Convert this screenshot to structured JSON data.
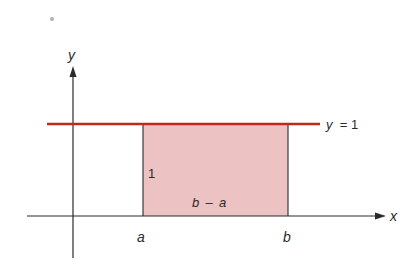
{
  "diagram": {
    "axes": {
      "x_label": "x",
      "y_label": "y"
    },
    "line": {
      "label_var": "y",
      "label_eq": "= 1",
      "color": "#c0281e"
    },
    "rectangle": {
      "fill": "#ecc2c2",
      "height_label": "1",
      "width_label_b": "b",
      "width_label_minus": "–",
      "width_label_a": "a"
    },
    "ticks": {
      "a": "a",
      "b": "b"
    },
    "colors": {
      "axis": "#2a2a2a",
      "line": "#c0281e",
      "region": "#ecc2c2",
      "dot": "#b0b0b0"
    }
  }
}
